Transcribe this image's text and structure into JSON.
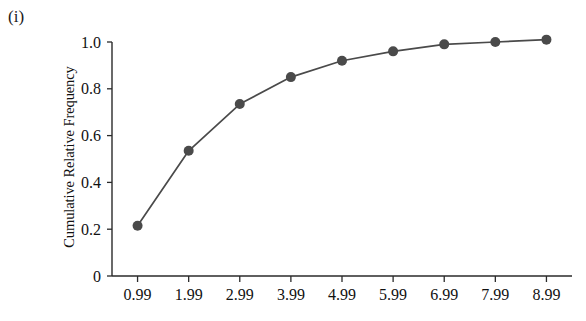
{
  "figure": {
    "panel_label": "(i)",
    "background_color": "#ffffff"
  },
  "chart_data": {
    "type": "line",
    "title": "",
    "subtitle": "",
    "panel_label": "(i)",
    "xlabel": "",
    "ylabel": "Cumulative Relative Frequency",
    "categories": [
      "0.99",
      "1.99",
      "2.99",
      "3.99",
      "4.99",
      "5.99",
      "6.99",
      "7.99",
      "8.99"
    ],
    "x": [
      0.99,
      1.99,
      2.99,
      3.99,
      4.99,
      5.99,
      6.99,
      7.99,
      8.99
    ],
    "values": [
      0.215,
      0.535,
      0.735,
      0.85,
      0.92,
      0.96,
      0.99,
      1.0,
      1.01
    ],
    "series": [
      {
        "name": "Cumulative Relative Frequency",
        "values": [
          0.215,
          0.535,
          0.735,
          0.85,
          0.92,
          0.96,
          0.99,
          1.0,
          1.01
        ],
        "color": "#4a4a4a",
        "marker": "circle",
        "marker_size": 5
      }
    ],
    "ylim": [
      0,
      1.05
    ],
    "xlim": [
      0.49,
      9.49
    ],
    "ytick_labels": [
      "0",
      "0.2",
      "0.4",
      "0.6",
      "0.8",
      "1.0"
    ],
    "ytick_values": [
      0,
      0.2,
      0.4,
      0.6,
      0.8,
      1.0
    ],
    "xtick_labels": [
      "0.99",
      "1.99",
      "2.99",
      "3.99",
      "4.99",
      "5.99",
      "6.99",
      "7.99",
      "8.99"
    ],
    "grid": false,
    "legend": "none",
    "line_color": "#4a4a4a",
    "marker_color": "#4a4a4a",
    "axis_color": "#2a2a2a"
  }
}
